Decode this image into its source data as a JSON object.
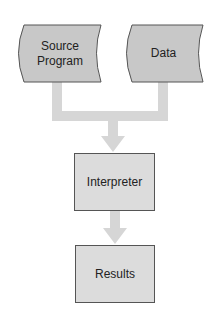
{
  "diagram": {
    "type": "flowchart",
    "colors": {
      "input_fill": "#c8c8c8",
      "process_fill": "#dcdcdc",
      "stroke": "#555555",
      "connector": "#d6d6d6",
      "text": "#222222"
    },
    "nodes": [
      {
        "id": "source_program",
        "shape": "stored-data",
        "label_line1": "Source",
        "label_line2": "Program"
      },
      {
        "id": "data",
        "shape": "stored-data",
        "label": "Data"
      },
      {
        "id": "interpreter",
        "shape": "rectangle",
        "label": "Interpreter"
      },
      {
        "id": "results",
        "shape": "rectangle",
        "label": "Results"
      }
    ],
    "edges": [
      {
        "from": "source_program",
        "to": "interpreter"
      },
      {
        "from": "data",
        "to": "interpreter"
      },
      {
        "from": "interpreter",
        "to": "results"
      }
    ]
  }
}
